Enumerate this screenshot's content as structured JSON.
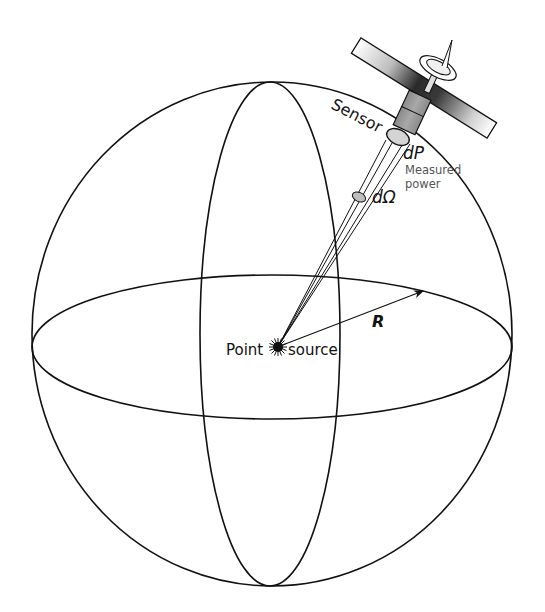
{
  "figure": {
    "labels": {
      "sensor": "Sensor",
      "dP": "dP",
      "measured_power_line1": "Measured",
      "measured_power_line2": "power",
      "d_omega": "dΩ",
      "radius": "R",
      "point": "Point",
      "source": "source"
    },
    "colors": {
      "line": "#111111",
      "sensor_body": "#9a9a9a",
      "sensor_aperture": "#d4d4d4",
      "panel_dark": "#2a2a2a",
      "panel_light": "#ffffff",
      "label_small": "#555555"
    }
  }
}
